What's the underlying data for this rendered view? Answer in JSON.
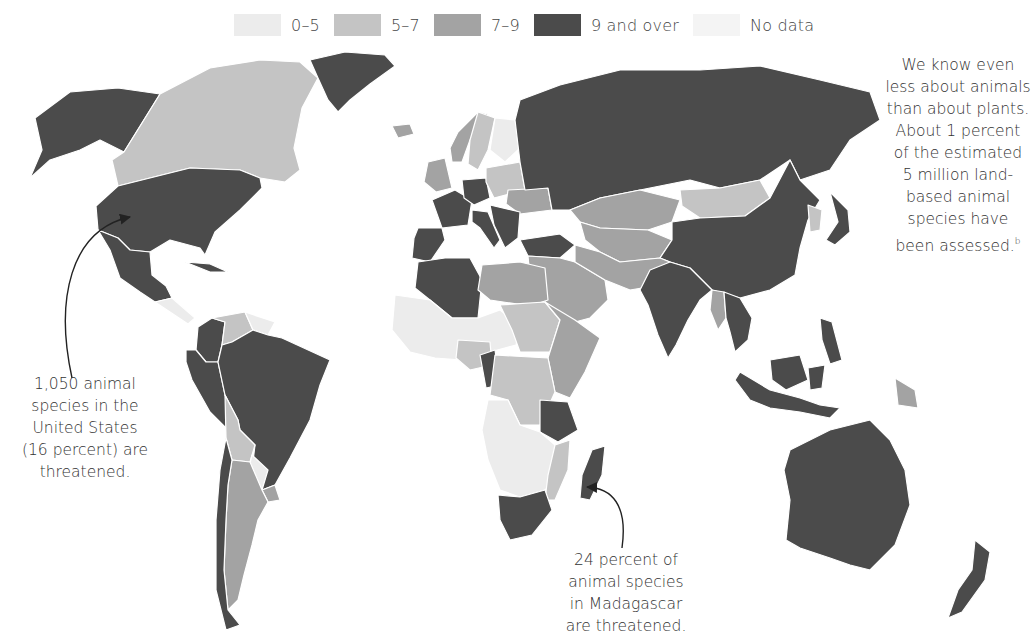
{
  "legend": {
    "items": [
      {
        "label": "0–5",
        "color": "#ececec"
      },
      {
        "label": "5–7",
        "color": "#c4c4c4"
      },
      {
        "label": "7–9",
        "color": "#a3a3a3"
      },
      {
        "label": "9 and over",
        "color": "#4b4b4b"
      },
      {
        "label": "No data",
        "color": "#f4f4f4"
      }
    ]
  },
  "annotations": {
    "animals_note": {
      "lines": [
        "We know even",
        "less about animals",
        "than about plants.",
        "About 1 percent",
        "of the estimated",
        "5 million land-",
        "based animal",
        "species have",
        "been assessed."
      ],
      "footnote_marker": "b"
    },
    "us_note": {
      "lines": [
        "1,050 animal",
        "species in the",
        "United States",
        "(16 percent) are",
        "threatened."
      ]
    },
    "madagascar_note": {
      "lines": [
        "24 percent of",
        "animal species",
        "in Madagascar",
        "are threatened."
      ]
    }
  },
  "map": {
    "border_color": "#ffffff",
    "arrow_color": "#222222",
    "regions": [
      {
        "name": "alaska",
        "class": "9 and over"
      },
      {
        "name": "canada",
        "class": "5–7"
      },
      {
        "name": "united-states",
        "class": "9 and over"
      },
      {
        "name": "mexico",
        "class": "9 and over"
      },
      {
        "name": "greenland",
        "class": "9 and over"
      },
      {
        "name": "central-america",
        "class": "0–5"
      },
      {
        "name": "cuba",
        "class": "9 and over"
      },
      {
        "name": "colombia",
        "class": "9 and over"
      },
      {
        "name": "venezuela",
        "class": "5–7"
      },
      {
        "name": "guianas",
        "class": "0–5"
      },
      {
        "name": "ecuador-peru",
        "class": "9 and over"
      },
      {
        "name": "brazil",
        "class": "9 and over"
      },
      {
        "name": "bolivia",
        "class": "5–7"
      },
      {
        "name": "paraguay",
        "class": "0–5"
      },
      {
        "name": "uruguay",
        "class": "7–9"
      },
      {
        "name": "argentina",
        "class": "7–9"
      },
      {
        "name": "chile",
        "class": "9 and over"
      },
      {
        "name": "iceland",
        "class": "7–9"
      },
      {
        "name": "norway",
        "class": "7–9"
      },
      {
        "name": "sweden",
        "class": "5–7"
      },
      {
        "name": "finland",
        "class": "0–5"
      },
      {
        "name": "uk-ireland",
        "class": "7–9"
      },
      {
        "name": "france",
        "class": "9 and over"
      },
      {
        "name": "iberia",
        "class": "9 and over"
      },
      {
        "name": "germany",
        "class": "9 and over"
      },
      {
        "name": "poland-baltics",
        "class": "5–7"
      },
      {
        "name": "ukraine",
        "class": "7–9"
      },
      {
        "name": "italy",
        "class": "9 and over"
      },
      {
        "name": "balkans",
        "class": "9 and over"
      },
      {
        "name": "turkey",
        "class": "9 and over"
      },
      {
        "name": "russia",
        "class": "9 and over"
      },
      {
        "name": "kazakhstan",
        "class": "7–9"
      },
      {
        "name": "central-asia",
        "class": "7–9"
      },
      {
        "name": "mongolia",
        "class": "5–7"
      },
      {
        "name": "china",
        "class": "9 and over"
      },
      {
        "name": "korea",
        "class": "5–7"
      },
      {
        "name": "japan",
        "class": "9 and over"
      },
      {
        "name": "middle-east",
        "class": "7–9"
      },
      {
        "name": "iran-afghanistan",
        "class": "7–9"
      },
      {
        "name": "india",
        "class": "9 and over"
      },
      {
        "name": "myanmar",
        "class": "7–9"
      },
      {
        "name": "southeast-asia",
        "class": "9 and over"
      },
      {
        "name": "indonesia",
        "class": "9 and over"
      },
      {
        "name": "philippines",
        "class": "9 and over"
      },
      {
        "name": "papua-new-guinea",
        "class": "7–9"
      },
      {
        "name": "australia",
        "class": "9 and over"
      },
      {
        "name": "new-zealand",
        "class": "9 and over"
      },
      {
        "name": "morocco-algeria",
        "class": "9 and over"
      },
      {
        "name": "libya-egypt",
        "class": "7–9"
      },
      {
        "name": "west-africa",
        "class": "0–5"
      },
      {
        "name": "nigeria",
        "class": "5–7"
      },
      {
        "name": "cameroon",
        "class": "9 and over"
      },
      {
        "name": "sudan",
        "class": "5–7"
      },
      {
        "name": "horn-of-africa",
        "class": "7–9"
      },
      {
        "name": "drc",
        "class": "5–7"
      },
      {
        "name": "tanzania",
        "class": "9 and over"
      },
      {
        "name": "southern-africa",
        "class": "0–5"
      },
      {
        "name": "mozambique",
        "class": "5–7"
      },
      {
        "name": "south-africa",
        "class": "9 and over"
      },
      {
        "name": "madagascar",
        "class": "9 and over"
      }
    ]
  }
}
